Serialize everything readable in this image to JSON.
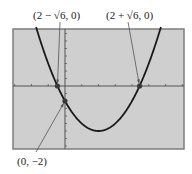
{
  "chart_data": {
    "type": "line",
    "title": "",
    "xlabel": "",
    "ylabel": "",
    "function": "y = x^2 - 4x - 2",
    "xlim": [
      -3.1,
      7.1
    ],
    "ylim": [
      -8.4,
      7.6
    ],
    "x_tick_step": 1,
    "y_tick_step": 1,
    "grid": false,
    "series": [
      {
        "name": "parabola",
        "vertex": [
          2,
          -6
        ],
        "color": "#1a1a1a"
      }
    ],
    "points": [
      {
        "x": -0.449,
        "y": 0,
        "label": "(2 − √6, 0)",
        "label_pos": "top"
      },
      {
        "x": 4.449,
        "y": 0,
        "label": "(2 + √6, 0)",
        "label_pos": "top"
      },
      {
        "x": 0,
        "y": -2,
        "label": "(0, −2)",
        "label_pos": "bottom-left"
      }
    ],
    "colors": {
      "screen_bg": "#cfcfcf",
      "frame": "#7d7d7d",
      "axis": "#555555",
      "curve": "#1a1a1a",
      "point": "#3a3a3a",
      "arrow": "#555555"
    }
  }
}
